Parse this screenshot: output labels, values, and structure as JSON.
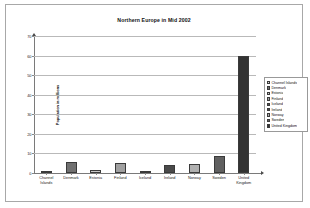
{
  "chart_data": {
    "type": "bar",
    "title": "Northern Europe in Mid 2002",
    "xlabel": "",
    "ylabel": "Population in millions",
    "ylim": [
      0,
      70
    ],
    "yticks": [
      70,
      60,
      50,
      40,
      30,
      20,
      10,
      0
    ],
    "grid": true,
    "legend_position": "right",
    "categories": [
      "Channel Islands",
      "Denmark",
      "Estonia",
      "Finland",
      "Iceland",
      "Ireland",
      "Norway",
      "Sweden",
      "United Kingdom"
    ],
    "category_lines": [
      [
        "Channel",
        "Islands"
      ],
      [
        "Denmark"
      ],
      [
        "Estonia"
      ],
      [
        "Finland"
      ],
      [
        "Iceland"
      ],
      [
        "Ireland"
      ],
      [
        "Norway"
      ],
      [
        "Sweden"
      ],
      [
        "United",
        "Kingdom"
      ]
    ],
    "values": [
      0.15,
      5.4,
      1.4,
      5.2,
      0.3,
      3.9,
      4.5,
      8.9,
      60
    ],
    "colors": [
      "#d9d9d9",
      "#707070",
      "#c8c8c8",
      "#a0a0a0",
      "#555555",
      "#4a4a4a",
      "#b0b0b0",
      "#606060",
      "#333333"
    ],
    "legend": [
      "Channel Islands",
      "Denmark",
      "Estonia",
      "Finland",
      "Iceland",
      "Ireland",
      "Norway",
      "Sweden",
      "United Kingdom"
    ]
  }
}
